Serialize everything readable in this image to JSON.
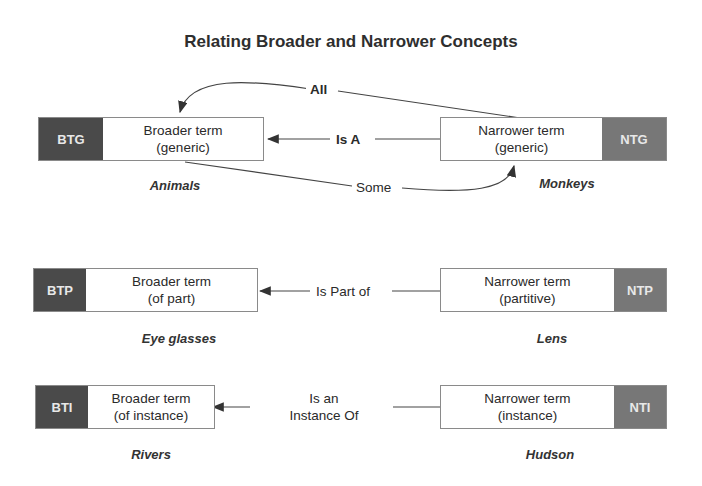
{
  "title": "Relating Broader and Narrower Concepts",
  "rows": [
    {
      "broader": {
        "tag": "BTG",
        "line1": "Broader term",
        "line2": "(generic)",
        "example": "Animals"
      },
      "narrower": {
        "tag": "NTG",
        "line1": "Narrower term",
        "line2": "(generic)",
        "example": "Monkeys"
      },
      "relation": "Is A",
      "extra_relations": {
        "top": "All",
        "bottom": "Some"
      }
    },
    {
      "broader": {
        "tag": "BTP",
        "line1": "Broader term",
        "line2": "(of part)",
        "example": "Eye glasses"
      },
      "narrower": {
        "tag": "NTP",
        "line1": "Narrower term",
        "line2": "(partitive)",
        "example": "Lens"
      },
      "relation": "Is Part of"
    },
    {
      "broader": {
        "tag": "BTI",
        "line1": "Broader term",
        "line2": "(of instance)",
        "example": "Rivers"
      },
      "narrower": {
        "tag": "NTI",
        "line1": "Narrower term",
        "line2": "(instance)",
        "example": "Hudson"
      },
      "relation_line1": "Is an",
      "relation_line2": "Instance Of"
    }
  ]
}
